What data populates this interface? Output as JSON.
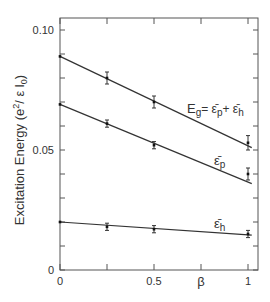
{
  "chart_data": {
    "type": "line",
    "title": "",
    "xlabel": "β",
    "ylabel": "Excitation Energy (e²/ε l₀)",
    "xlim": [
      0,
      1.05
    ],
    "ylim": [
      0,
      0.1
    ],
    "x_ticks": [
      0,
      0.25,
      0.5,
      0.75,
      1
    ],
    "x_tick_labels": [
      "0",
      "",
      "0.5",
      "",
      "1"
    ],
    "y_ticks": [
      0,
      0.01,
      0.02,
      0.03,
      0.04,
      0.05,
      0.06,
      0.07,
      0.08,
      0.09,
      0.1
    ],
    "y_tick_labels": [
      "0",
      "",
      "",
      "",
      "",
      "0.05",
      "",
      "",
      "",
      "",
      "0.10"
    ],
    "grid": false,
    "legend": "inline labels",
    "series": [
      {
        "name": "E_g = ε̄_p + ε̄_h",
        "label_main": "E",
        "label_sub": "g",
        "label_rest": "= ε̄",
        "label_sub2": "p",
        "label_rest2": "+ ε̄",
        "label_sub3": "h",
        "points": [
          {
            "x": 0,
            "y": 0.089,
            "err": 0
          },
          {
            "x": 0.25,
            "y": 0.08,
            "err": 0.0025
          },
          {
            "x": 0.5,
            "y": 0.07,
            "err": 0.0025
          },
          {
            "x": 1,
            "y": 0.053,
            "err": 0.003
          }
        ],
        "fit": {
          "x0": 0,
          "y0": 0.089,
          "x1": 1.02,
          "y1": 0.051
        }
      },
      {
        "name": "ε̄_p",
        "label_main": "ε̄",
        "label_sub": "p",
        "points": [
          {
            "x": 0,
            "y": 0.069,
            "err": 0
          },
          {
            "x": 0.25,
            "y": 0.061,
            "err": 0.0015
          },
          {
            "x": 0.5,
            "y": 0.052,
            "err": 0.0015
          },
          {
            "x": 1,
            "y": 0.04,
            "err": 0.0025
          }
        ],
        "fit": {
          "x0": 0,
          "y0": 0.069,
          "x1": 1.02,
          "y1": 0.036
        }
      },
      {
        "name": "ε̄_h",
        "label_main": "ε̄",
        "label_sub": "h",
        "points": [
          {
            "x": 0,
            "y": 0.02,
            "err": 0
          },
          {
            "x": 0.25,
            "y": 0.018,
            "err": 0.0015
          },
          {
            "x": 0.5,
            "y": 0.017,
            "err": 0.0015
          },
          {
            "x": 1,
            "y": 0.015,
            "err": 0.0015
          }
        ],
        "fit": {
          "x0": 0,
          "y0": 0.02,
          "x1": 1.02,
          "y1": 0.0145
        }
      }
    ]
  },
  "labels": {
    "ylabel_text": "Excitation Energy (e",
    "ylabel_sup": "2",
    "ylabel_tail": "/ ε l",
    "ylabel_sub": "0",
    "ylabel_close": ")",
    "xlabel": "β",
    "eg_E": "E",
    "eg_g": "g",
    "eg_eq": "= ε̄",
    "eg_p": "p",
    "eg_plus": "+ ε̄",
    "eg_h": "h",
    "ep_eps": "ε̄",
    "ep_p": "p",
    "eh_eps": "ε̄",
    "eh_h": "h"
  },
  "colors": {
    "ink": "#333333",
    "frame": "#555555",
    "background": "#ffffff"
  }
}
